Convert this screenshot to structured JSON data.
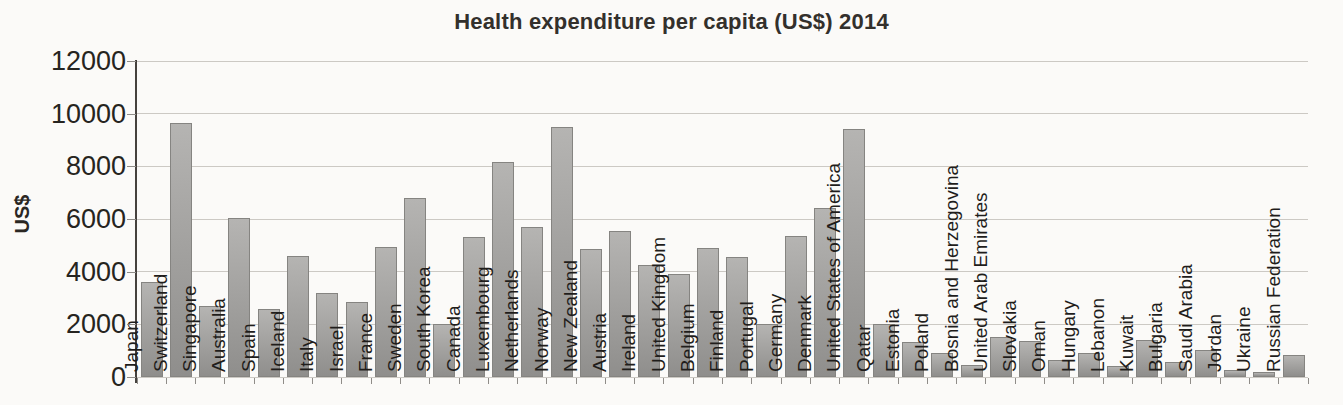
{
  "chart_data": {
    "type": "bar",
    "title": "Health expenditure per capita (US$) 2014",
    "ylabel": "US$",
    "xlabel": "",
    "ylim": [
      0,
      12000
    ],
    "yticks": [
      0,
      2000,
      4000,
      6000,
      8000,
      10000,
      12000
    ],
    "grid": true,
    "legend_position": "none",
    "categories": [
      "Japan",
      "Switzerland",
      "Singapore",
      "Australia",
      "Spain",
      "Iceland",
      "Italy",
      "Israel",
      "France",
      "Sweden",
      "South Korea",
      "Canada",
      "Luxembourg",
      "Netherlands",
      "Norway",
      "New Zealand",
      "Austria",
      "Ireland",
      "United Kingdom",
      "Belgium",
      "Finland",
      "Portugal",
      "Germany",
      "Denmark",
      "United States of America",
      "Qatar",
      "Estonia",
      "Poland",
      "Bosnia and Herzegovina",
      "United Arab Emirates",
      "Slovakia",
      "Oman",
      "Hungary",
      "Lebanon",
      "Kuwait",
      "Bulgaria",
      "Saudi Arabia",
      "Jordan",
      "Ukraine",
      "Russian Federation"
    ],
    "values": [
      3600,
      9650,
      2700,
      6050,
      2600,
      4600,
      3200,
      2850,
      4950,
      6800,
      2000,
      5300,
      8150,
      5700,
      9500,
      4850,
      5550,
      4250,
      3900,
      4900,
      4550,
      2000,
      5350,
      6400,
      9400,
      2000,
      1330,
      900,
      450,
      1500,
      1370,
      650,
      930,
      400,
      1400,
      570,
      1030,
      280,
      200,
      850
    ],
    "colors": {
      "bar_gradient_top": "#b5b4b2",
      "bar_gradient_bottom": "#8f8e8c",
      "bar_border": "#858481",
      "bar_label": "#1f1d1b",
      "gridline": "#ccc9c4",
      "axis_line": "#45413d",
      "tick": "#8f8c88",
      "ytick_label": "#262420",
      "title": "#33302c",
      "background": "#fbfaf8"
    }
  }
}
